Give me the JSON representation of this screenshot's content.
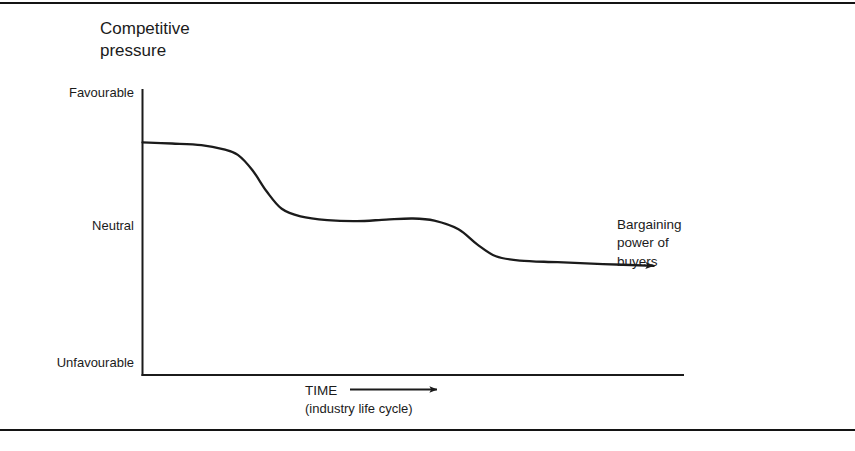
{
  "figure": {
    "title_line1": "Competitive",
    "title_line2": "pressure",
    "background": "#ffffff",
    "ink_color": "#1b1b1b",
    "rule_color": "#141414"
  },
  "annotations": {
    "buyers_line1": "Bargaining",
    "buyers_line2": "power of",
    "buyers_line3": "buyers",
    "xaxis_line1": "TIME",
    "xaxis_line2": "(industry life cycle)"
  },
  "chart_data": {
    "type": "line",
    "xlabel": "TIME (industry life cycle)",
    "ylabel": "Competitive pressure",
    "grid": false,
    "legend": null,
    "y_tick_labels": [
      "Favourable",
      "Neutral",
      "Unfavourable"
    ],
    "y_tick_values": [
      3,
      2,
      1
    ],
    "ylim": [
      0.6,
      3.25
    ],
    "xlim": [
      0,
      10
    ],
    "x_tick_labels": [],
    "series": [
      {
        "name": "Competitive pressure over industry life cycle",
        "arrow_end": true,
        "points": [
          {
            "x": 0.0,
            "y": 2.755
          },
          {
            "x": 0.55,
            "y": 2.745
          },
          {
            "x": 1.1,
            "y": 2.73
          },
          {
            "x": 1.52,
            "y": 2.69
          },
          {
            "x": 1.78,
            "y": 2.64
          },
          {
            "x": 2.05,
            "y": 2.5
          },
          {
            "x": 2.32,
            "y": 2.3
          },
          {
            "x": 2.6,
            "y": 2.14
          },
          {
            "x": 2.95,
            "y": 2.07
          },
          {
            "x": 3.45,
            "y": 2.035
          },
          {
            "x": 4.0,
            "y": 2.025
          },
          {
            "x": 4.55,
            "y": 2.04
          },
          {
            "x": 5.05,
            "y": 2.05
          },
          {
            "x": 5.45,
            "y": 2.03
          },
          {
            "x": 5.9,
            "y": 1.95
          },
          {
            "x": 6.25,
            "y": 1.81
          },
          {
            "x": 6.6,
            "y": 1.7
          },
          {
            "x": 7.05,
            "y": 1.66
          },
          {
            "x": 7.75,
            "y": 1.645
          },
          {
            "x": 8.6,
            "y": 1.628
          },
          {
            "x": 9.55,
            "y": 1.612
          }
        ]
      }
    ],
    "axis_note": "Y axis drawn as vertical spine from Favourable down to Unfavourable; X axis drawn as horizontal spine with a separate TIME arrow caption below."
  }
}
